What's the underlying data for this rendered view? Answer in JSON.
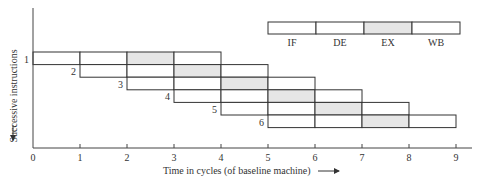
{
  "diagram": {
    "type": "pipeline-timing",
    "y_axis_label": "Successive instructions",
    "x_axis_label": "Time in cycles (of baseline machine)",
    "x_ticks": [
      "0",
      "1",
      "2",
      "3",
      "4",
      "5",
      "6",
      "7",
      "8",
      "9"
    ],
    "stage_fill_colors": {
      "normal": "#ffffff",
      "highlight": "#e6e6e6"
    },
    "legend": {
      "stages": [
        {
          "label": "IF",
          "highlight": false
        },
        {
          "label": "DE",
          "highlight": false
        },
        {
          "label": "EX",
          "highlight": true
        },
        {
          "label": "WB",
          "highlight": false
        }
      ]
    },
    "instructions": [
      {
        "label": "1",
        "start_cycle": 0,
        "stages": [
          "IF",
          "DE",
          "EX",
          "WB"
        ]
      },
      {
        "label": "2",
        "start_cycle": 1,
        "stages": [
          "IF",
          "DE",
          "EX",
          "WB"
        ]
      },
      {
        "label": "3",
        "start_cycle": 2,
        "stages": [
          "IF",
          "DE",
          "EX",
          "WB"
        ]
      },
      {
        "label": "4",
        "start_cycle": 3,
        "stages": [
          "IF",
          "DE",
          "EX",
          "WB"
        ]
      },
      {
        "label": "5",
        "start_cycle": 4,
        "stages": [
          "IF",
          "DE",
          "EX",
          "WB"
        ]
      },
      {
        "label": "6",
        "start_cycle": 5,
        "stages": [
          "IF",
          "DE",
          "EX",
          "WB"
        ]
      }
    ]
  }
}
